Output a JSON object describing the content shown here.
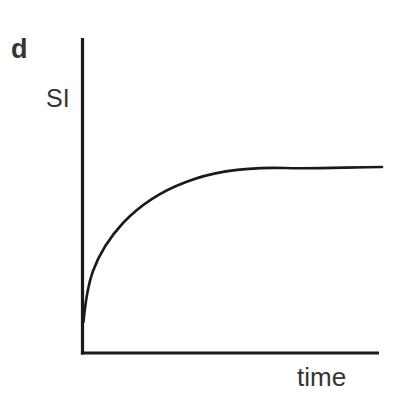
{
  "figure": {
    "panel_label": "d",
    "background_color": "#ffffff",
    "ink_color": "#1a1a1a",
    "label_color": "#343434",
    "width": 394,
    "height": 406
  },
  "chart_data": {
    "type": "line",
    "title": "d",
    "xlabel": "time",
    "ylabel": "SI",
    "grid": false,
    "legend": null,
    "axes": {
      "x_axis_visible": true,
      "y_axis_visible": true,
      "x_ticks": [],
      "y_ticks": [],
      "x_tick_labels": [],
      "y_tick_labels": [],
      "xlim": [
        0,
        1
      ],
      "ylim": [
        0,
        1
      ]
    },
    "annotations": [],
    "series": [
      {
        "name": "signal intensity",
        "description": "monoexponential saturation recovery rising steeply from baseline then plateauing",
        "x": [
          0.0,
          0.01,
          0.02,
          0.03,
          0.05,
          0.08,
          0.12,
          0.17,
          0.23,
          0.3,
          0.38,
          0.47,
          0.57,
          0.68,
          0.8,
          0.9,
          1.0
        ],
        "y": [
          0.1,
          0.18,
          0.25,
          0.31,
          0.39,
          0.47,
          0.55,
          0.62,
          0.68,
          0.73,
          0.78,
          0.82,
          0.85,
          0.88,
          0.9,
          0.91,
          0.92
        ]
      }
    ]
  },
  "geometry": {
    "axis_origin_x": 82.5,
    "axis_origin_y": 353,
    "y_axis_top": 38,
    "x_axis_right": 379,
    "curve_start_x": 83.5,
    "curve_start_y": 322,
    "curve_end_x": 382,
    "curve_end_y": 167,
    "axis_stroke_width": 3.2,
    "curve_stroke_width": 2.6,
    "curve_path": "M 83.5 322 C 85.5 300 88 285 93 271 C 100 252 110 237 123 223 C 140 205 162 191 186 182 C 214 171 250 167 285 168 C 315 169 352 167 382 167"
  },
  "labels": {
    "panel": "d",
    "y_axis": "SI",
    "x_axis": "time"
  }
}
